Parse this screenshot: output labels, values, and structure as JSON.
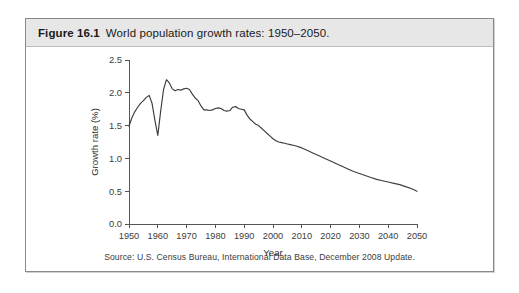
{
  "figure": {
    "number": "Figure 16.1",
    "caption": "World population growth rates: 1950–2050.",
    "source": "Source: U.S. Census Bureau, International Data Base, December 2008 Update."
  },
  "colors": {
    "caption_band": "#e7e7e7",
    "border": "#8a8a8a",
    "line": "#3d3d3d",
    "axis": "#555555",
    "page": "#ffffff"
  },
  "chart_data": {
    "type": "line",
    "title": "World population growth rates: 1950–2050",
    "xlabel": "Year",
    "ylabel": "Growth rate (%)",
    "xlim": [
      1950,
      2050
    ],
    "ylim": [
      0.0,
      2.5
    ],
    "grid": false,
    "legend": null,
    "xticks": [
      1950,
      1960,
      1970,
      1980,
      1990,
      2000,
      2010,
      2020,
      2030,
      2040,
      2050
    ],
    "yticks": [
      0.0,
      0.5,
      1.0,
      1.5,
      2.0,
      2.5
    ],
    "ytick_labels": [
      "0.0",
      "0.5",
      "1.0",
      "1.5",
      "2.0",
      "2.5"
    ],
    "xtick_labels": [
      "1950",
      "1960",
      "1970",
      "1980",
      "1990",
      "2000",
      "2010",
      "2020",
      "2030",
      "2040",
      "2050"
    ],
    "series": [
      {
        "name": "World population growth rate",
        "x": [
          1950,
          1951,
          1952,
          1953,
          1954,
          1955,
          1956,
          1957,
          1958,
          1959,
          1960,
          1961,
          1962,
          1963,
          1964,
          1965,
          1966,
          1967,
          1968,
          1969,
          1970,
          1971,
          1972,
          1973,
          1974,
          1975,
          1976,
          1977,
          1978,
          1979,
          1980,
          1981,
          1982,
          1983,
          1984,
          1985,
          1986,
          1987,
          1988,
          1989,
          1990,
          1991,
          1992,
          1993,
          1994,
          1995,
          1996,
          1997,
          1998,
          1999,
          2000,
          2001,
          2002,
          2003,
          2004,
          2005,
          2006,
          2007,
          2008,
          2010,
          2012,
          2014,
          2016,
          2018,
          2020,
          2022,
          2024,
          2026,
          2028,
          2030,
          2032,
          2034,
          2036,
          2038,
          2040,
          2042,
          2044,
          2046,
          2048,
          2050
        ],
        "y": [
          1.49,
          1.62,
          1.71,
          1.78,
          1.84,
          1.88,
          1.93,
          1.96,
          1.84,
          1.58,
          1.35,
          1.72,
          2.05,
          2.2,
          2.15,
          2.06,
          2.03,
          2.05,
          2.04,
          2.06,
          2.07,
          2.05,
          1.98,
          1.92,
          1.88,
          1.8,
          1.74,
          1.74,
          1.73,
          1.74,
          1.76,
          1.77,
          1.76,
          1.73,
          1.72,
          1.73,
          1.78,
          1.79,
          1.76,
          1.75,
          1.74,
          1.66,
          1.6,
          1.56,
          1.52,
          1.5,
          1.46,
          1.42,
          1.38,
          1.34,
          1.3,
          1.27,
          1.25,
          1.24,
          1.23,
          1.22,
          1.21,
          1.2,
          1.19,
          1.16,
          1.12,
          1.08,
          1.04,
          1.0,
          0.96,
          0.92,
          0.88,
          0.84,
          0.8,
          0.77,
          0.74,
          0.71,
          0.68,
          0.66,
          0.64,
          0.62,
          0.6,
          0.57,
          0.54,
          0.5
        ]
      }
    ]
  }
}
